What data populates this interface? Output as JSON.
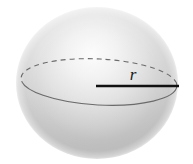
{
  "figure": {
    "kind": "sphere-radius-diagram",
    "background_color": "#ffffff",
    "canvas": {
      "width": 193,
      "height": 164
    }
  },
  "sphere": {
    "name": "shaded-sphere",
    "center_x": 97,
    "center_y": 83,
    "radius_x": 81,
    "radius_y": 76,
    "highlight_x": 92,
    "highlight_y": 52,
    "highlight_color": "#fbfbfb",
    "mid_color": "#d8d8d8",
    "edge_color": "#a9a9a9",
    "fade_color": "#ffffff"
  },
  "equator": {
    "name": "equator-ellipse",
    "center_x": 99,
    "center_y": 82,
    "radius_x": 78,
    "radius_y": 23,
    "rotation_deg": 3,
    "stroke_color": "#6b6b6b",
    "stroke_width": 1.1,
    "front_style": "solid",
    "back_style": "dashed",
    "dash_pattern": "5 4"
  },
  "radius_line": {
    "name": "radius-line",
    "x1": 96,
    "y1": 86,
    "x2": 179,
    "y2": 86,
    "stroke_color": "#111111",
    "stroke_width": 2.4
  },
  "labels": {
    "radius": {
      "text": "r",
      "x": 133,
      "y": 80,
      "font_size": 17,
      "color": "#1a1a1a"
    }
  }
}
